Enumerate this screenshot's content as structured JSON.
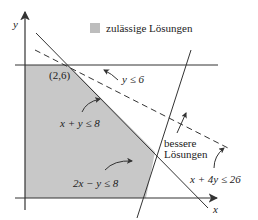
{
  "diagram": {
    "type": "linear-programming-feasible-region",
    "axes": {
      "x_label": "x",
      "y_label": "y"
    },
    "legend": {
      "swatch_color": "#bdbdbd",
      "label": "zulässige Lösungen"
    },
    "feasible_region_color": "#c8c8c8",
    "constraints": [
      {
        "id": "c1",
        "label": "y ≤ 6",
        "style": "solid"
      },
      {
        "id": "c2",
        "label": "x + y ≤ 8",
        "style": "solid"
      },
      {
        "id": "c3",
        "label": "2x − y ≤ 8",
        "style": "solid"
      },
      {
        "id": "c4",
        "label": "x + 4y ≤ 26",
        "style": "dashed"
      }
    ],
    "point_label": "(2,6)",
    "direction_label_line1": "bessere",
    "direction_label_line2": "Lösungen"
  }
}
